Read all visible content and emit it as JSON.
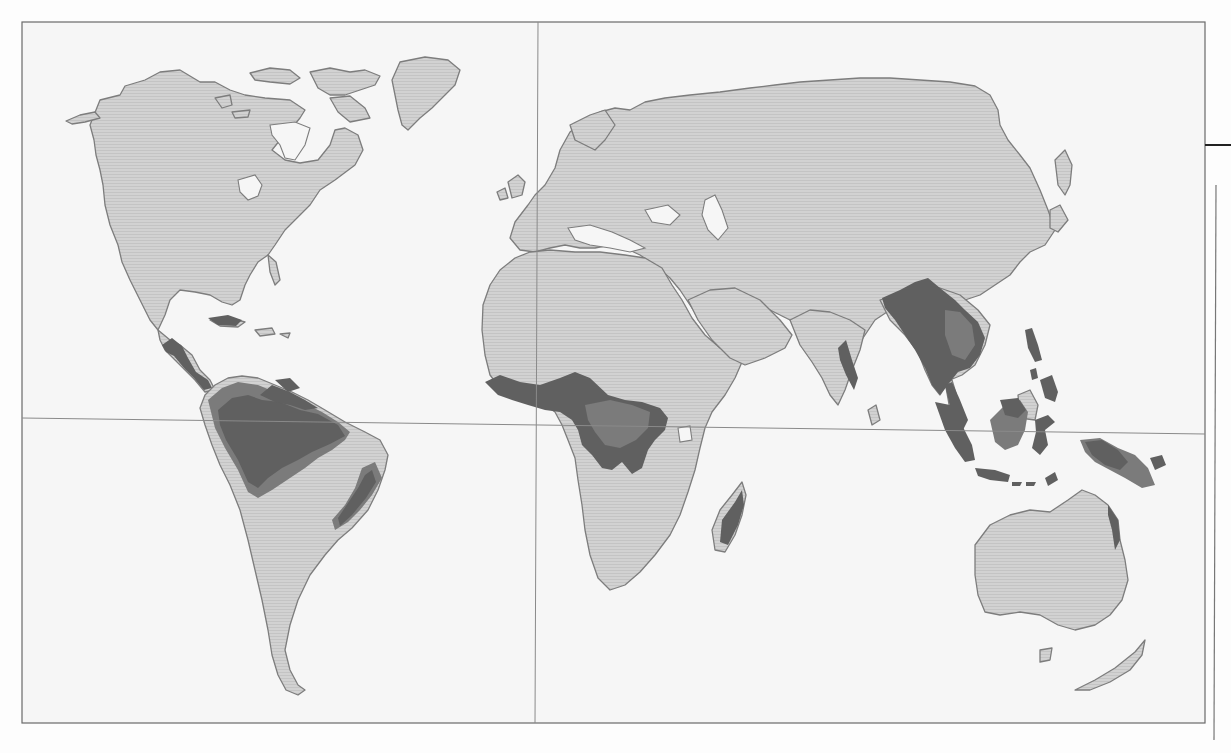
{
  "map": {
    "type": "world-map",
    "subject": "tropical rainforest distribution",
    "colors": {
      "ocean": "#f6f6f6",
      "land": "#cfcfcf",
      "land_outline": "#7d7d7d",
      "rainforest_dense": "#606060",
      "rainforest_secondary": "#7b7b7b",
      "frame": "#6a6a6a"
    },
    "reference_lines": [
      {
        "name": "equator",
        "orientation": "horizontal",
        "y": 420
      },
      {
        "name": "prime-meridian",
        "orientation": "vertical",
        "x": 535
      }
    ],
    "highlighted_regions": [
      "Central America",
      "Amazon Basin",
      "Atlantic coast of Brazil",
      "West Africa",
      "Congo Basin",
      "Eastern Madagascar",
      "Western Ghats",
      "Sri Lanka",
      "Southeast Asia mainland",
      "Philippines",
      "Indonesia",
      "New Guinea",
      "Northeast Australia"
    ],
    "labels": []
  }
}
